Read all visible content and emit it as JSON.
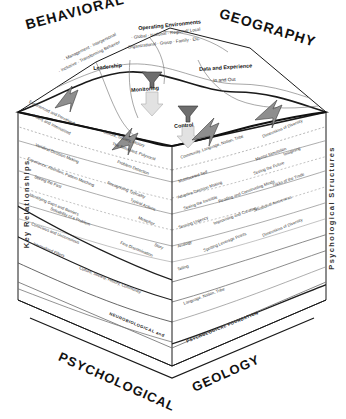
{
  "figure": {
    "corners": {
      "top_left": "BEHAVIORAL",
      "top_right": "GEOGRAPHY",
      "bottom_left": "PSYCHOLOGICAL",
      "bottom_right": "GEOLOGY"
    },
    "axes": {
      "left": "Key Relationships",
      "right": "Psychological Structures"
    }
  },
  "top_surface": {
    "operating_environments": {
      "title": "Operating Environments",
      "line1": "· Global · National · Regional/ Local",
      "line2": "· Organizational · Group · Family · Etc."
    },
    "leadership": {
      "title": "Leadership",
      "line1": "· Management · Interpersonal",
      "line2": "· Inclusive · Transforming Behavior"
    },
    "data_and_experience": {
      "title": "Data and Experience",
      "subtitle": "In and Out"
    },
    "monitoring_label": "Monitoring",
    "control_label": "Control"
  },
  "left_face_strata": [
    "Experienced and Perceived",
    "Filters and Internalized",
    "Culture, Society, History",
    "Veridical Decision Making",
    "The Saturated, Polyvocal",
    "Experience, Attention, Pattern Matching",
    "Problem Detection",
    "Seeing the Past",
    "Recognizing Typicality",
    "Identifying Gaps and Barriers",
    "Typical Actions",
    "Solvability of a Problem",
    "Metaphor",
    "Conscious and Unconscious",
    "Fine Discrimination",
    "Story",
    "Internalized Filters",
    "Culture, Society, History, Community"
  ],
  "right_face_strata": [
    "Community, Language, Nation, Tribe",
    "Dimensions of Diversity",
    "Multifaceted Self",
    "Mental Simulation",
    "Imagining",
    "Adaptive Decision Making",
    "Seeing the Future",
    "Seeing the Invisible",
    "Reading and Constructing Minds",
    "Tricks of the Trade",
    "Sensing Urgency",
    "Improvising and Creating",
    "Situational Awareness",
    "Analogy",
    "Spotting Leverage Points",
    "Dimensions of Diversity",
    "Telling",
    "Language, Nation, Tribe"
  ],
  "foundation": {
    "left": "NEUROBIOLOGICAL and",
    "right": "PSYCHOLOGICAL FOUNDATION"
  },
  "colors": {
    "ink": "#1a1a1a",
    "stratum_line": "#8a8a8a",
    "arrow_gray": "#8e8e8e",
    "arrow_light": "#d2d2d2",
    "paper": "#ffffff"
  }
}
